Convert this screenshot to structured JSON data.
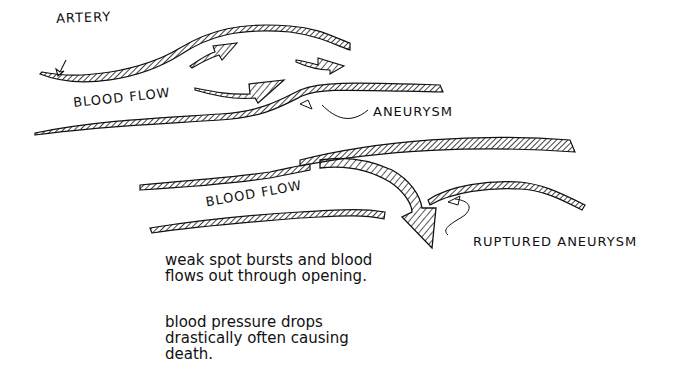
{
  "diagram": {
    "top_section": {
      "labels": {
        "artery": "ARTERY",
        "blood_flow": "BLOOD FLOW",
        "aneurysm": "ANEURYSM"
      }
    },
    "bottom_section": {
      "labels": {
        "blood_flow": "BLOOD FLOW",
        "ruptured_aneurysm": "RUPTURED ANEURYSM"
      },
      "notes": [
        "weak spot bursts and blood flows out through opening.",
        "blood pressure drops drastically often causing death."
      ]
    },
    "colors": {
      "ink": "#111111",
      "background": "#ffffff"
    }
  }
}
